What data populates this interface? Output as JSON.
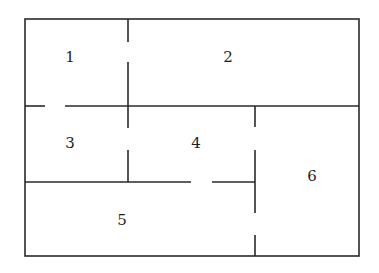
{
  "diagram": {
    "type": "floor-plan",
    "rooms": [
      {
        "id": "1",
        "label": "1",
        "x": 70,
        "y": 57
      },
      {
        "id": "2",
        "label": "2",
        "x": 228,
        "y": 57
      },
      {
        "id": "3",
        "label": "3",
        "x": 70,
        "y": 143
      },
      {
        "id": "4",
        "label": "4",
        "x": 196,
        "y": 143
      },
      {
        "id": "5",
        "label": "5",
        "x": 122,
        "y": 220
      },
      {
        "id": "6",
        "label": "6",
        "x": 312,
        "y": 176
      }
    ],
    "line_color": "#2a2a2a",
    "background": "#ffffff"
  }
}
